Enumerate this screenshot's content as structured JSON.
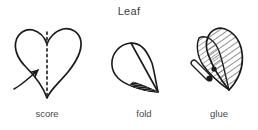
{
  "title": "Leaf",
  "colors": {
    "background": "#ffffff",
    "ink": "#1a1a1a",
    "text": "#3a3a3a",
    "hatch": "#555555"
  },
  "steps": [
    {
      "index": 1,
      "label": "score",
      "shape": "heart-with-dashed-center-line",
      "annotation": "curved-arrow-pointing-to-fold-line"
    },
    {
      "index": 2,
      "label": "fold",
      "shape": "folded-teardrop-leaf",
      "annotation": "hatched-folded-edge"
    },
    {
      "index": 3,
      "label": "glue",
      "shape": "two-hatched-leaf-halves",
      "annotation": "glue-applicator-tube"
    }
  ]
}
